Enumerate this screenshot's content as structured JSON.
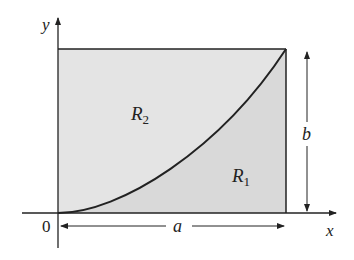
{
  "diagram": {
    "labels": {
      "y_axis": "y",
      "x_axis": "x",
      "origin": "0",
      "region_upper": "R",
      "region_upper_sub": "2",
      "region_lower": "R",
      "region_lower_sub": "1",
      "width_dim": "a",
      "height_dim": "b"
    },
    "colors": {
      "fill": "#e4e4e4",
      "stroke": "#222222",
      "background": "#ffffff"
    }
  }
}
